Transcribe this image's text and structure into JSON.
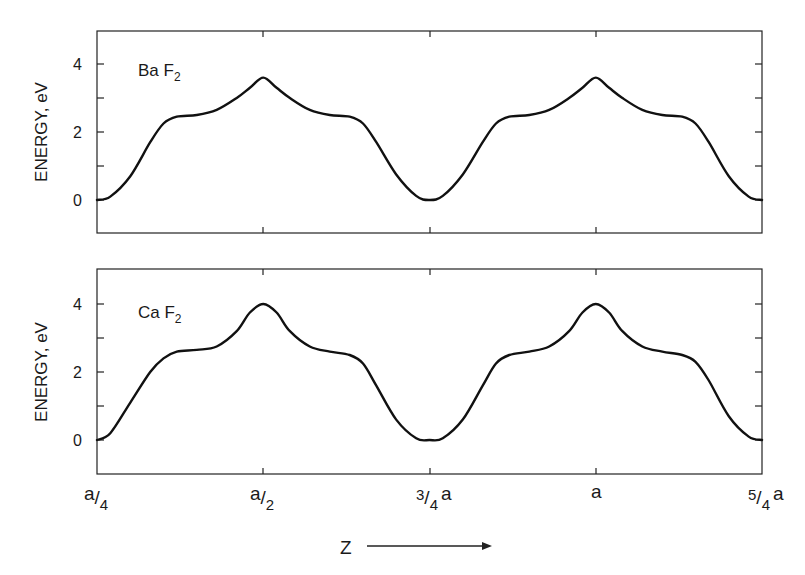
{
  "figure": {
    "xlabel": "Z",
    "xlabel_arrow": "arrow-right",
    "x_ticks": [
      {
        "num": "a",
        "den": "4",
        "suffix": ""
      },
      {
        "num": "a",
        "den": "2",
        "suffix": ""
      },
      {
        "num": "3",
        "den": "4",
        "suffix": "a"
      },
      {
        "num": "",
        "den": "",
        "suffix": "a"
      },
      {
        "num": "5",
        "den": "4",
        "suffix": "a"
      }
    ],
    "colors": {
      "line": "#111111",
      "frame": "#222222",
      "background": "#ffffff"
    }
  },
  "chart_data": [
    {
      "type": "line",
      "title": "Ba F2",
      "panel_label": "Ba F",
      "panel_label_sub": "2",
      "xlabel": "Z",
      "ylabel": "ENERGY, eV",
      "x_tick_labels": [
        "a/4",
        "a/2",
        "3/4 a",
        "a",
        "5/4 a"
      ],
      "x_unit": "a",
      "xlim": [
        0.25,
        1.25
      ],
      "ylim": [
        -1,
        5
      ],
      "y_ticks": [
        0,
        1,
        2,
        3,
        4
      ],
      "y_tick_labels": [
        "0",
        "2",
        "4"
      ],
      "grid": false,
      "legend": "none",
      "x": [
        0.25,
        0.27,
        0.3,
        0.33,
        0.35,
        0.37,
        0.4,
        0.43,
        0.46,
        0.48,
        0.5,
        0.52,
        0.54,
        0.57,
        0.6,
        0.63,
        0.65,
        0.67,
        0.7,
        0.73,
        0.75,
        0.77,
        0.8,
        0.83,
        0.85,
        0.87,
        0.9,
        0.93,
        0.96,
        0.98,
        1.0,
        1.02,
        1.04,
        1.07,
        1.1,
        1.13,
        1.15,
        1.17,
        1.2,
        1.23,
        1.25
      ],
      "values": [
        0.0,
        0.1,
        0.7,
        1.7,
        2.25,
        2.45,
        2.5,
        2.65,
        3.0,
        3.3,
        3.6,
        3.3,
        3.0,
        2.65,
        2.5,
        2.45,
        2.25,
        1.7,
        0.75,
        0.12,
        0.0,
        0.12,
        0.75,
        1.7,
        2.25,
        2.45,
        2.5,
        2.65,
        3.0,
        3.3,
        3.6,
        3.3,
        3.0,
        2.65,
        2.5,
        2.45,
        2.25,
        1.7,
        0.7,
        0.1,
        0.0
      ],
      "peak_value": 3.6,
      "shoulder_value": 2.5,
      "min_value": 0.0
    },
    {
      "type": "line",
      "title": "Ca F2",
      "panel_label": "Ca F",
      "panel_label_sub": "2",
      "xlabel": "Z",
      "ylabel": "ENERGY, eV",
      "x_tick_labels": [
        "a/4",
        "a/2",
        "3/4 a",
        "a",
        "5/4 a"
      ],
      "x_unit": "a",
      "xlim": [
        0.25,
        1.25
      ],
      "ylim": [
        -1,
        5
      ],
      "y_ticks": [
        0,
        1,
        2,
        3,
        4
      ],
      "y_tick_labels": [
        "0",
        "2",
        "4"
      ],
      "grid": false,
      "legend": "none",
      "x": [
        0.25,
        0.27,
        0.3,
        0.33,
        0.35,
        0.37,
        0.4,
        0.43,
        0.46,
        0.48,
        0.5,
        0.52,
        0.54,
        0.57,
        0.6,
        0.63,
        0.65,
        0.67,
        0.7,
        0.73,
        0.75,
        0.77,
        0.8,
        0.83,
        0.85,
        0.87,
        0.9,
        0.93,
        0.96,
        0.98,
        1.0,
        1.02,
        1.04,
        1.07,
        1.1,
        1.13,
        1.15,
        1.17,
        1.2,
        1.23,
        1.25
      ],
      "values": [
        0.0,
        0.2,
        1.1,
        2.0,
        2.4,
        2.6,
        2.65,
        2.75,
        3.2,
        3.75,
        4.0,
        3.75,
        3.2,
        2.75,
        2.6,
        2.5,
        2.25,
        1.6,
        0.6,
        0.05,
        0.0,
        0.05,
        0.6,
        1.6,
        2.25,
        2.5,
        2.6,
        2.75,
        3.2,
        3.75,
        4.0,
        3.75,
        3.2,
        2.75,
        2.6,
        2.5,
        2.3,
        1.75,
        0.7,
        0.1,
        0.0
      ],
      "peak_value": 4.0,
      "shoulder_value": 2.6,
      "min_value": 0.0
    }
  ]
}
